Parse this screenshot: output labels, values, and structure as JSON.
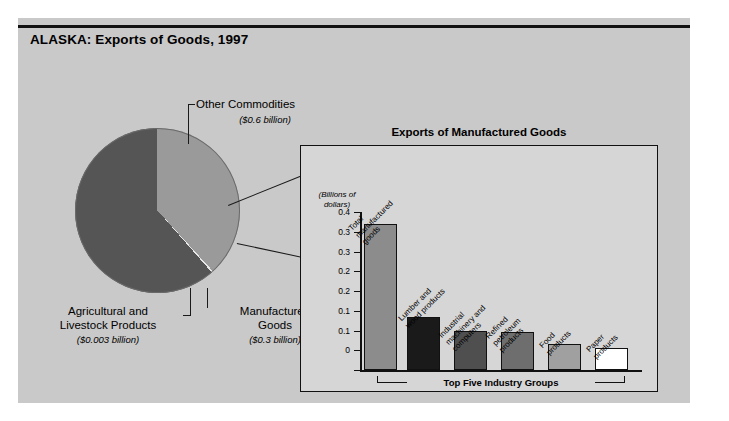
{
  "page_title": "ALASKA: Exports of Goods, 1997",
  "pie": {
    "slices": [
      {
        "name": "Other Commodities",
        "amount_label": "($0.6 billion)",
        "value": 0.6,
        "color": "#555555"
      },
      {
        "name": "Manufactured\nGoods",
        "amount_label": "($0.3 billion)",
        "value": 0.3,
        "color": "#9a9a9a"
      },
      {
        "name": "Agricultural and\nLivestock Products",
        "amount_label": "($0.003 billion)",
        "value": 0.003,
        "color": "#e8e8e8"
      }
    ]
  },
  "inset": {
    "title": "Exports of Manufactured Goods",
    "y_unit": "(Billions of\ndollars)",
    "bracket_label": "Top Five Industry Groups"
  },
  "chart_data": {
    "type": "bar",
    "title": "Exports of Manufactured Goods",
    "xlabel": "",
    "ylabel": "(Billions of dollars)",
    "ylim": [
      0,
      0.4
    ],
    "grid": false,
    "legend": "none",
    "ytick_labels": [
      "0.4",
      "0.3",
      "0.3",
      "0.2",
      "0.2",
      "0.1",
      "0.1",
      "0"
    ],
    "ytick_values": [
      0.4,
      0.35,
      0.3,
      0.25,
      0.2,
      0.15,
      0.1,
      0.05,
      0
    ],
    "categories": [
      "Total manufactured goods",
      "Lumber and wood products",
      "Industrial machinery and computers",
      "Refined petroleum products",
      "Food products",
      "Paper products"
    ],
    "values": [
      0.37,
      0.135,
      0.1,
      0.095,
      0.065,
      0.055
    ],
    "bar_colors": [
      "#8c8c8c",
      "#1a1a1a",
      "#4f4f4f",
      "#6e6e6e",
      "#a0a0a0",
      "#ffffff"
    ],
    "annotations": [
      "Top Five Industry Groups"
    ]
  }
}
